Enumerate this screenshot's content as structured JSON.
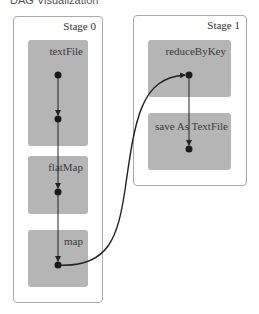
{
  "header": {
    "title": "DAG Visualization"
  },
  "stages": [
    {
      "label": "Stage 0",
      "operations": [
        {
          "label": "textFile"
        },
        {
          "label": "flatMap"
        },
        {
          "label": "map"
        }
      ]
    },
    {
      "label": "Stage 1",
      "operations": [
        {
          "label": "reduceByKey"
        },
        {
          "label": "save As TextFile"
        }
      ]
    }
  ],
  "colors": {
    "stage_border": "#a9a9a9",
    "operation_fill": "#b5b5b5",
    "node": "#1a1a1a",
    "edge": "#222222"
  }
}
